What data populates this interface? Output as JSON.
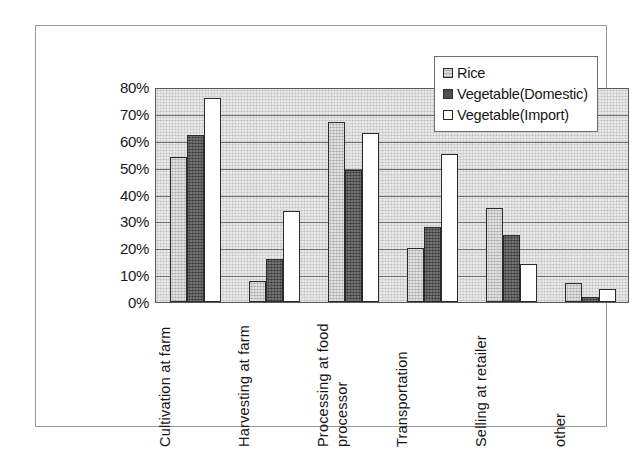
{
  "chart_data": {
    "type": "bar",
    "title": "",
    "xlabel": "",
    "ylabel": "",
    "ylim": [
      0,
      80
    ],
    "ytick_labels": [
      "80%",
      "70%",
      "60%",
      "50%",
      "40%",
      "30%",
      "20%",
      "10%",
      "0%"
    ],
    "ytick_values": [
      80,
      70,
      60,
      50,
      40,
      30,
      20,
      10,
      0
    ],
    "grid": true,
    "legend_position": "top-right",
    "categories": [
      "Cultivation at farm",
      "Harvesting at farm",
      "Processing at food processor",
      "Transportation",
      "Selling at retailer",
      "other"
    ],
    "category_lines": [
      [
        "Cultivation at farm"
      ],
      [
        "Harvesting at farm"
      ],
      [
        "Processing at food",
        "processor"
      ],
      [
        "Transportation"
      ],
      [
        "Selling at retailer"
      ],
      [
        "other"
      ]
    ],
    "series": [
      {
        "name": "Rice",
        "color": "#bdbdbd",
        "values": [
          54,
          8,
          67,
          20,
          35,
          7
        ]
      },
      {
        "name": "Vegetable(Domestic)",
        "color": "#4f4f4f",
        "values": [
          62,
          16,
          49,
          28,
          25,
          2
        ]
      },
      {
        "name": "Vegetable(Import)",
        "color": "#ffffff",
        "values": [
          76,
          34,
          63,
          55,
          14,
          5
        ]
      }
    ]
  },
  "legend": {
    "items": [
      {
        "label": "Rice"
      },
      {
        "label": "Vegetable(Domestic)"
      },
      {
        "label": "Vegetable(Import)"
      }
    ]
  },
  "axis": {
    "y_ticks": [
      "80%",
      "70%",
      "60%",
      "50%",
      "40%",
      "30%",
      "20%",
      "10%",
      "0%"
    ]
  }
}
